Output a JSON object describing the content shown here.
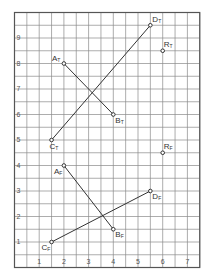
{
  "chart_data": {
    "type": "scatter",
    "title": "",
    "xlabel": "",
    "ylabel": "",
    "xlim": [
      0,
      7.5
    ],
    "ylim": [
      0,
      10
    ],
    "grid": true,
    "grid_step": 0.5,
    "x_ticks": [
      "1",
      "2",
      "3",
      "4",
      "5",
      "6",
      "7"
    ],
    "y_ticks": [
      "1",
      "2",
      "3",
      "4",
      "5",
      "6",
      "7",
      "8",
      "9"
    ],
    "points": [
      {
        "name": "A",
        "sub": "T",
        "x": 2,
        "y": 8,
        "label_pos": "left"
      },
      {
        "name": "B",
        "sub": "T",
        "x": 4,
        "y": 6,
        "label_pos": "below-right"
      },
      {
        "name": "C",
        "sub": "T",
        "x": 1.5,
        "y": 5,
        "label_pos": "below"
      },
      {
        "name": "D",
        "sub": "T",
        "x": 5.5,
        "y": 9.5,
        "label_pos": "right"
      },
      {
        "name": "R",
        "sub": "T",
        "x": 6,
        "y": 8.5,
        "label_pos": "above-right"
      },
      {
        "name": "A",
        "sub": "F",
        "x": 2,
        "y": 4,
        "label_pos": "below-left"
      },
      {
        "name": "B",
        "sub": "F",
        "x": 4,
        "y": 1.5,
        "label_pos": "below-right"
      },
      {
        "name": "C",
        "sub": "F",
        "x": 1.5,
        "y": 1,
        "label_pos": "below-left"
      },
      {
        "name": "D",
        "sub": "F",
        "x": 5.5,
        "y": 3,
        "label_pos": "below-right"
      },
      {
        "name": "R",
        "sub": "F",
        "x": 6,
        "y": 4.5,
        "label_pos": "above-right"
      }
    ],
    "segments": [
      {
        "from": "A_T",
        "to": "B_T",
        "x1": 2,
        "y1": 8,
        "x2": 4,
        "y2": 6
      },
      {
        "from": "C_T",
        "to": "D_T",
        "x1": 1.5,
        "y1": 5,
        "x2": 5.5,
        "y2": 9.5
      },
      {
        "from": "A_F",
        "to": "B_F",
        "x1": 2,
        "y1": 4,
        "x2": 4,
        "y2": 1.5
      },
      {
        "from": "C_F",
        "to": "D_F",
        "x1": 1.5,
        "y1": 1,
        "x2": 5.5,
        "y2": 3
      }
    ]
  },
  "style": {
    "grid_color": "#8a8a8a",
    "border_color": "#555555",
    "line_color": "#333333",
    "point_color": "#333333"
  }
}
